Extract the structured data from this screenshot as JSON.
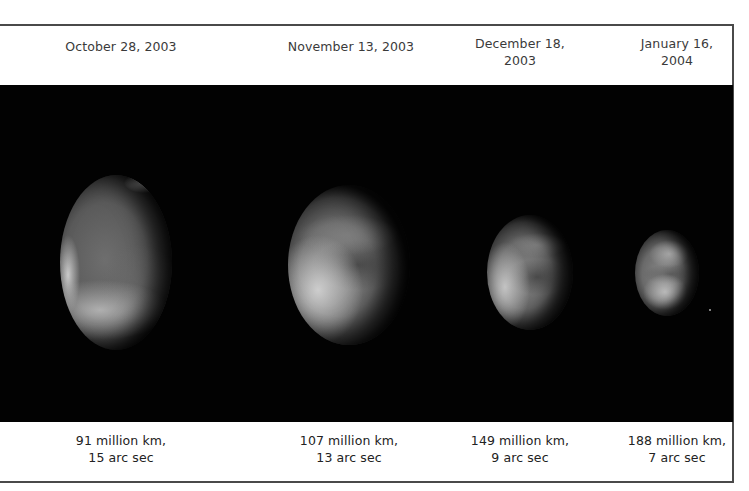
{
  "figure": {
    "panels": [
      {
        "date_lines": [
          "October 28, 2003"
        ],
        "distance_lines": [
          "91 million km,",
          "15 arc sec"
        ],
        "distance_million_km": 91,
        "angular_size_arcsec": 15
      },
      {
        "date_lines": [
          "November 13, 2003"
        ],
        "distance_lines": [
          "107 million km,",
          "13 arc sec"
        ],
        "distance_million_km": 107,
        "angular_size_arcsec": 13
      },
      {
        "date_lines": [
          "December 18,",
          "2003"
        ],
        "distance_lines": [
          "149 million km,",
          "9 arc sec"
        ],
        "distance_million_km": 149,
        "angular_size_arcsec": 9
      },
      {
        "date_lines": [
          "January 16,",
          "2004"
        ],
        "distance_lines": [
          "188 million km,",
          "7 arc sec"
        ],
        "distance_million_km": 188,
        "angular_size_arcsec": 7
      }
    ],
    "colors": {
      "background": "#ffffff",
      "image_band": "#020202",
      "rules": "#4a4a4a",
      "text": "#3a3a3a"
    }
  }
}
